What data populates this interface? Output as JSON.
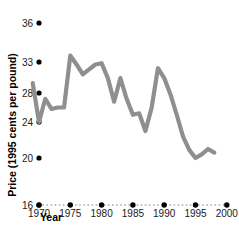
{
  "chart_data": {
    "type": "line",
    "title": "",
    "xlabel": "Year",
    "ylabel": "Price (1995 cents per pound)",
    "xlim": [
      1968,
      2001
    ],
    "ylim": [
      16,
      37
    ],
    "grid": "dotted-baseline-only",
    "legend": "none",
    "line_color": "#8f8f8f",
    "tick_color": "#000000",
    "xticks": [
      1970,
      1975,
      1980,
      1985,
      1990,
      1995,
      2000
    ],
    "xtick_labels": [
      "1970",
      "1975",
      "1980",
      "1985",
      "1990",
      "1995",
      "2000"
    ],
    "yticks": [
      16,
      20,
      24,
      28,
      33,
      36
    ],
    "ytick_labels": [
      "16",
      "20",
      "24",
      "28",
      "33",
      "36"
    ],
    "x": [
      1969,
      1970,
      1971,
      1972,
      1973,
      1974,
      1975,
      1976,
      1977,
      1978,
      1979,
      1980,
      1981,
      1982,
      1983,
      1984,
      1985,
      1986,
      1987,
      1988,
      1989,
      1990,
      1991,
      1992,
      1993,
      1994,
      1995,
      1996,
      1997,
      1998
    ],
    "values": [
      29.6,
      24.0,
      27.2,
      25.8,
      26.0,
      26.0,
      33.5,
      32.6,
      31.0,
      31.8,
      32.6,
      32.8,
      30.4,
      26.8,
      30.4,
      27.2,
      25.0,
      25.2,
      23.0,
      26.0,
      32.0,
      30.4,
      27.8,
      25.0,
      22.4,
      20.9,
      20.0,
      20.4,
      21.0,
      20.6
    ],
    "series_name": "Price"
  },
  "axes": {
    "x_title": "Year",
    "y_title": "Price (1995 cents per pound)"
  }
}
